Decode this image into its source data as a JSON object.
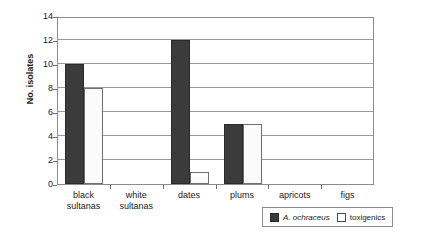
{
  "chart_data": {
    "type": "bar",
    "title": "",
    "xlabel": "",
    "ylabel": "No. isolates",
    "categories": [
      "black sultanas",
      "white sultanas",
      "dates",
      "plums",
      "apricots",
      "figs"
    ],
    "category_lines": [
      [
        "black",
        "sultanas"
      ],
      [
        "white",
        "sultanas"
      ],
      [
        "dates",
        ""
      ],
      [
        "plums",
        ""
      ],
      [
        "apricots",
        ""
      ],
      [
        "figs",
        ""
      ]
    ],
    "series": [
      {
        "name": "A. ochraceus",
        "values": [
          10,
          0,
          12,
          5,
          0,
          0
        ],
        "color": "#3b3b3b",
        "italic": true
      },
      {
        "name": "toxigenics",
        "values": [
          8,
          0,
          1,
          5,
          0,
          0
        ],
        "color": "#ffffff",
        "italic": false
      }
    ],
    "ylim": [
      0,
      14
    ],
    "yticks": [
      0,
      2,
      4,
      6,
      8,
      10,
      12,
      14
    ],
    "ytick_labels": [
      "0",
      "2",
      "4",
      "6",
      "8",
      "10",
      "12",
      "14"
    ],
    "grid": true,
    "legend_position": "bottom-right"
  }
}
